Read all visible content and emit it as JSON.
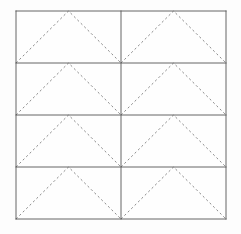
{
  "figure": {
    "canvas": {
      "width": 241,
      "height": 234,
      "background_color": "#fdfdfd"
    },
    "grid": {
      "x": 16,
      "y": 11,
      "width": 210,
      "height": 208,
      "rows": 4,
      "columns": 2,
      "cell_width": 105,
      "cell_height": 52,
      "fill_color": "#fefefe",
      "line_color": "#555555",
      "line_width": 0.9,
      "column_boundaries_x": [
        16,
        121,
        226
      ],
      "row_boundaries_y": [
        11,
        63,
        115,
        167,
        219
      ]
    },
    "chevrons": {
      "count": 8,
      "shape": "triangle-open",
      "stroke_color": "#8a8a8a",
      "stroke_width": 1,
      "dash_pattern": "2.2 2.6",
      "apex_position": "top-center",
      "base_positions": [
        "bottom-left",
        "bottom-right"
      ],
      "cells": [
        {
          "id": "cell-r1c1",
          "row": 1,
          "column": 1,
          "x": 16,
          "y": 11,
          "width": 105,
          "height": 52
        },
        {
          "id": "cell-r1c2",
          "row": 1,
          "column": 2,
          "x": 121,
          "y": 11,
          "width": 105,
          "height": 52
        },
        {
          "id": "cell-r2c1",
          "row": 2,
          "column": 1,
          "x": 16,
          "y": 63,
          "width": 105,
          "height": 52
        },
        {
          "id": "cell-r2c2",
          "row": 2,
          "column": 2,
          "x": 121,
          "y": 63,
          "width": 105,
          "height": 52
        },
        {
          "id": "cell-r3c1",
          "row": 3,
          "column": 1,
          "x": 16,
          "y": 115,
          "width": 105,
          "height": 52
        },
        {
          "id": "cell-r3c2",
          "row": 3,
          "column": 2,
          "x": 121,
          "y": 115,
          "width": 105,
          "height": 52
        },
        {
          "id": "cell-r4c1",
          "row": 4,
          "column": 1,
          "x": 16,
          "y": 167,
          "width": 105,
          "height": 52
        },
        {
          "id": "cell-r4c2",
          "row": 4,
          "column": 2,
          "x": 121,
          "y": 167,
          "width": 105,
          "height": 52
        }
      ]
    },
    "labels": []
  }
}
